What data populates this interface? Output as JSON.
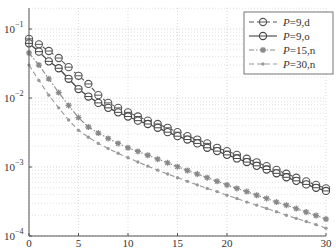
{
  "chart_data": {
    "type": "line",
    "title": "",
    "xlabel": "",
    "ylabel": "",
    "xscale": "linear",
    "yscale": "log",
    "xlim": [
      0,
      30
    ],
    "ylim": [
      0.0001,
      0.19
    ],
    "grid": true,
    "legend_position": "upper right",
    "x_ticks": [
      0,
      5,
      10,
      15,
      20,
      30
    ],
    "x_tick_labels": [
      "0",
      "5",
      "10",
      "15",
      "20",
      "30"
    ],
    "y_ticks": [
      0.1,
      0.01,
      0.001,
      0.0001
    ],
    "y_tick_labels": [
      {
        "base": "10",
        "exp": "-1"
      },
      {
        "base": "10",
        "exp": "-2"
      },
      {
        "base": "10",
        "exp": "-3"
      },
      {
        "base": "10",
        "exp": "-4"
      }
    ],
    "x": [
      0,
      1,
      2,
      3,
      4,
      5,
      6,
      7,
      8,
      9,
      10,
      11,
      12,
      13,
      14,
      15,
      16,
      17,
      18,
      19,
      20,
      21,
      22,
      23,
      24,
      25,
      26,
      27,
      28,
      29,
      30
    ],
    "series": [
      {
        "name": "P=9,d",
        "label_italic": "P",
        "label_rest": "=9,d",
        "line_style": "dashed",
        "marker": "circle-bar",
        "color": "#555555",
        "values": [
          0.072,
          0.06,
          0.048,
          0.038,
          0.028,
          0.021,
          0.016,
          0.011,
          0.0085,
          0.0072,
          0.0062,
          0.0054,
          0.0047,
          0.0042,
          0.0037,
          0.0032,
          0.0028,
          0.0025,
          0.0022,
          0.0019,
          0.0017,
          0.0015,
          0.00132,
          0.00117,
          0.00103,
          0.00091,
          0.0008,
          0.0007,
          0.00062,
          0.00055,
          0.00049
        ]
      },
      {
        "name": "P=9,o",
        "label_italic": "P",
        "label_rest": "=9,o",
        "line_style": "solid",
        "marker": "circle-bar",
        "color": "#444444",
        "values": [
          0.062,
          0.047,
          0.034,
          0.027,
          0.019,
          0.0135,
          0.0105,
          0.0085,
          0.0072,
          0.0062,
          0.0054,
          0.0047,
          0.0042,
          0.0037,
          0.0032,
          0.0028,
          0.0025,
          0.0022,
          0.0019,
          0.0017,
          0.0015,
          0.00133,
          0.00118,
          0.00104,
          0.00092,
          0.00081,
          0.00071,
          0.00063,
          0.00056,
          0.0005,
          0.00045
        ]
      },
      {
        "name": "P=15,n",
        "label_italic": "P",
        "label_rest": "=15,n",
        "line_style": "dashdot",
        "marker": "star",
        "color": "#888888",
        "values": [
          0.045,
          0.03,
          0.019,
          0.012,
          0.0078,
          0.0052,
          0.0038,
          0.0031,
          0.0026,
          0.0022,
          0.0019,
          0.00168,
          0.00148,
          0.0013,
          0.00115,
          0.00101,
          0.00089,
          0.00079,
          0.0007,
          0.00062,
          0.00055,
          0.00049,
          0.00044,
          0.00039,
          0.00035,
          0.00031,
          0.00028,
          0.00025,
          0.000222,
          0.000198,
          0.000176
        ]
      },
      {
        "name": "P=30,n",
        "label_italic": "P",
        "label_rest": "=30,n",
        "line_style": "dashed",
        "marker": "dot",
        "color": "#999999",
        "values": [
          0.03,
          0.018,
          0.011,
          0.0072,
          0.0048,
          0.0034,
          0.0027,
          0.0022,
          0.00185,
          0.00158,
          0.00136,
          0.00118,
          0.00103,
          0.0009,
          0.00079,
          0.0007,
          0.00062,
          0.00055,
          0.00049,
          0.00044,
          0.00039,
          0.00035,
          0.00031,
          0.00028,
          0.00025,
          0.000225,
          0.0002,
          0.00018,
          0.000162,
          0.000146,
          0.00013
        ]
      }
    ]
  }
}
